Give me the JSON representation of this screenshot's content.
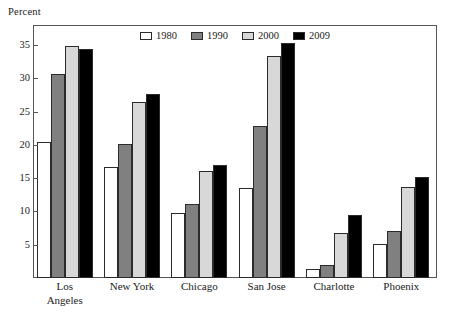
{
  "chart_data": {
    "type": "bar",
    "title": "",
    "subtitle": "",
    "xlabel": "",
    "ylabel": "Percent",
    "ylim": [
      0,
      38
    ],
    "yticks": [
      5,
      10,
      15,
      20,
      25,
      30,
      35
    ],
    "ytick_labels": [
      "5",
      "10",
      "15",
      "20",
      "25",
      "30",
      "35"
    ],
    "grid": false,
    "legend_position": "top-center",
    "categories": [
      "Los Angeles",
      "New York",
      "Chicago",
      "San Jose",
      "Charlotte",
      "Phoenix"
    ],
    "category_lines": [
      [
        "Los",
        "Angeles"
      ],
      [
        "New York"
      ],
      [
        "Chicago"
      ],
      [
        "San Jose"
      ],
      [
        "Charlotte"
      ],
      [
        "Phoenix"
      ]
    ],
    "series": [
      {
        "name": "1980",
        "color": "#ffffff",
        "values": [
          20.4,
          16.6,
          9.8,
          13.5,
          1.4,
          5.1
        ]
      },
      {
        "name": "1990",
        "color": "#808080",
        "values": [
          30.7,
          20.2,
          11.1,
          22.9,
          2.0,
          7.0
        ]
      },
      {
        "name": "2000",
        "color": "#d8d8d8",
        "values": [
          34.8,
          26.4,
          16.0,
          33.4,
          6.8,
          13.7
        ]
      },
      {
        "name": "2009",
        "color": "#000000",
        "values": [
          34.4,
          27.6,
          17.0,
          35.3,
          9.5,
          15.1
        ]
      }
    ]
  },
  "axis": {
    "y_title": "Percent"
  },
  "colors": {
    "frame": "#555555",
    "bar_outline": "#2b2b2b",
    "background": "#ffffff",
    "text": "#1a1a1a"
  }
}
